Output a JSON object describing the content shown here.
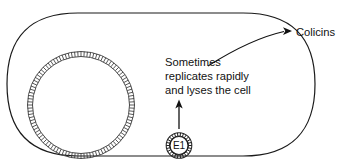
{
  "figure": {
    "background_color": "#ffffff",
    "line_color": "#1a1a1a",
    "width": 342,
    "height": 168
  },
  "cell": {
    "name": "bacterial-cell",
    "shape": "capsule"
  },
  "chromosome": {
    "name": "chromosome-ring",
    "shape": "hatched-circle"
  },
  "plasmid": {
    "name": "colicin-plasmid",
    "label": "E1",
    "shape": "hatched-circle"
  },
  "annotations": {
    "replication_note": {
      "lines": [
        "Sometimes",
        "replicates rapidly",
        "and lyses the cell"
      ],
      "line1": "Sometimes",
      "line2": "replicates rapidly",
      "line3": "and lyses the cell"
    },
    "colicins": {
      "label": "Colicins"
    }
  },
  "icons": {
    "up_arrow": "arrow-up-icon",
    "right_arrow": "arrow-right-icon"
  }
}
